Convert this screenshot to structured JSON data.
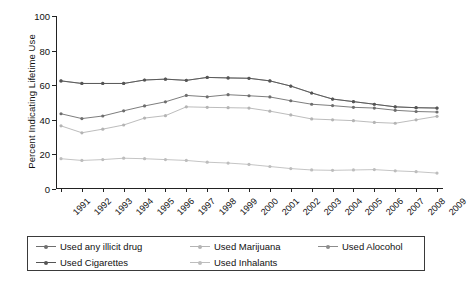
{
  "chart_data": {
    "type": "line",
    "title": "",
    "xlabel": "",
    "ylabel": "Percent Indicating Lifetime Use",
    "categories": [
      "1991",
      "1992",
      "1993",
      "1994",
      "1995",
      "1996",
      "1997",
      "1998",
      "1999",
      "2000",
      "2001",
      "2002",
      "2003",
      "2004",
      "2005",
      "2006",
      "2007",
      "2008",
      "2009"
    ],
    "x": [
      1991,
      1992,
      1993,
      1994,
      1995,
      1996,
      1997,
      1998,
      1999,
      2000,
      2001,
      2002,
      2003,
      2004,
      2005,
      2006,
      2007,
      2008,
      2009
    ],
    "ylim": [
      0,
      100
    ],
    "xlim": [
      1991,
      2009
    ],
    "yticks": [
      "0",
      "20",
      "40",
      "60",
      "80",
      "100"
    ],
    "ytick_values": [
      0,
      20,
      40,
      60,
      80,
      100
    ],
    "grid": false,
    "legend_position": "below",
    "series": [
      {
        "name": "Used any illicit drug",
        "color": "#6e6e6e",
        "values": [
          43.5,
          40.7,
          42.2,
          45.2,
          48.0,
          50.4,
          54.1,
          53.3,
          54.5,
          53.9,
          53.2,
          51.0,
          49.0,
          48.2,
          47.2,
          46.8,
          45.5,
          44.8,
          44.5
        ]
      },
      {
        "name": "Used Marijuana",
        "color": "#b4b4b4",
        "values": [
          36.5,
          32.5,
          34.6,
          37.0,
          41.0,
          42.4,
          47.5,
          47.2,
          47.0,
          46.8,
          45.0,
          42.8,
          40.5,
          40.0,
          39.5,
          38.5,
          38.0,
          40.0,
          42.0
        ]
      },
      {
        "name": "Used Alocohol",
        "color": "#8c8c8c",
        "values": [
          62.5,
          61.0,
          61.0,
          61.0,
          63.0,
          63.5,
          62.8,
          64.5,
          64.2,
          64.0,
          62.5,
          59.5,
          55.5,
          52.0,
          50.5,
          49.0,
          47.5,
          47.0,
          46.8
        ]
      },
      {
        "name": "Used Cigarettes",
        "color": "#555555",
        "values": [
          62.5,
          61.0,
          61.0,
          61.0,
          63.0,
          63.5,
          62.8,
          64.5,
          64.2,
          64.0,
          62.5,
          59.5,
          55.5,
          52.0,
          50.5,
          49.0,
          47.5,
          47.0,
          46.8
        ]
      },
      {
        "name": "Used Inhalants",
        "color": "#bdbdbd",
        "values": [
          17.5,
          16.5,
          17.0,
          17.8,
          17.5,
          17.0,
          16.5,
          15.5,
          15.0,
          14.2,
          13.0,
          11.8,
          11.0,
          10.8,
          11.0,
          11.2,
          10.5,
          10.0,
          9.2
        ]
      }
    ]
  },
  "legend": {
    "items": [
      {
        "label": "Used any illicit drug",
        "color": "#6e6e6e"
      },
      {
        "label": "Used Marijuana",
        "color": "#b4b4b4"
      },
      {
        "label": "Used Alocohol",
        "color": "#8c8c8c"
      },
      {
        "label": "Used Cigarettes",
        "color": "#555555"
      },
      {
        "label": "Used Inhalants",
        "color": "#bdbdbd"
      }
    ]
  },
  "colors": {
    "axis": "#222222",
    "background": "#ffffff",
    "text": "#111111"
  }
}
